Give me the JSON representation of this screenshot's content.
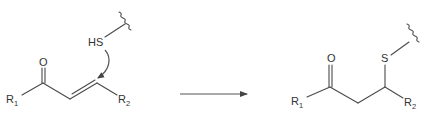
{
  "diagram": {
    "type": "reaction-scheme",
    "reactant": {
      "oxygen_label": "O",
      "r1_label": "R",
      "r1_sub": "1",
      "r2_label": "R",
      "r2_sub": "2",
      "thiol_label": "HS",
      "bonds": [
        "C=O",
        "C=C (alkene)",
        "S–wavy (attachment)"
      ],
      "mechanism_arrow": "curved arrow from HS to alkene β-carbon"
    },
    "reaction_arrow": {
      "direction": "right",
      "color": "#555555"
    },
    "product": {
      "oxygen_label": "O",
      "sulfur_label": "S",
      "r1_label": "R",
      "r1_sub": "1",
      "r2_label": "R",
      "r2_sub": "2",
      "bonds": [
        "C=O",
        "C–C (saturated)",
        "C–S",
        "S–wavy (attachment)"
      ]
    },
    "colors": {
      "line": "#4a4a4a",
      "text": "#333333",
      "background": "#ffffff"
    }
  }
}
